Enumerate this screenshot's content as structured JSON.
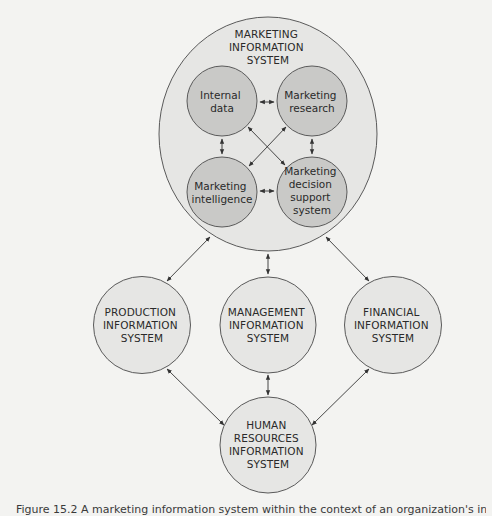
{
  "diagram": {
    "colors": {
      "background": "#f3f3f1",
      "outer_fill": "#e6e6e4",
      "inner_fill": "#c9c9c7",
      "stroke": "#5a5a5a",
      "text": "#2a2a2a"
    },
    "nodes": {
      "mis": {
        "label_lines": [
          "MARKETING",
          "INFORMATION",
          "SYSTEM"
        ]
      },
      "internal_data": {
        "label_lines": [
          "Internal",
          "data"
        ]
      },
      "marketing_research": {
        "label_lines": [
          "Marketing",
          "research"
        ]
      },
      "marketing_intelligence": {
        "label_lines": [
          "Marketing",
          "intelligence"
        ]
      },
      "mdss": {
        "label_lines": [
          "Marketing",
          "decision",
          "support",
          "system"
        ]
      },
      "production": {
        "label_lines": [
          "PRODUCTION",
          "INFORMATION",
          "SYSTEM"
        ]
      },
      "management": {
        "label_lines": [
          "MANAGEMENT",
          "INFORMATION",
          "SYSTEM"
        ]
      },
      "financial": {
        "label_lines": [
          "FINANCIAL",
          "INFORMATION",
          "SYSTEM"
        ]
      },
      "hr": {
        "label_lines": [
          "HUMAN",
          "RESOURCES",
          "INFORMATION",
          "SYSTEM"
        ]
      }
    },
    "edges": [
      {
        "from": "Internal data",
        "to": "Marketing research",
        "type": "bidirectional"
      },
      {
        "from": "Internal data",
        "to": "Marketing intelligence",
        "type": "bidirectional"
      },
      {
        "from": "Internal data",
        "to": "Marketing decision support system",
        "type": "bidirectional"
      },
      {
        "from": "Marketing research",
        "to": "Marketing intelligence",
        "type": "bidirectional"
      },
      {
        "from": "Marketing research",
        "to": "Marketing decision support system",
        "type": "bidirectional"
      },
      {
        "from": "Marketing intelligence",
        "to": "Marketing decision support system",
        "type": "bidirectional"
      },
      {
        "from": "Marketing Information System",
        "to": "Production Information System",
        "type": "bidirectional"
      },
      {
        "from": "Marketing Information System",
        "to": "Management Information System",
        "type": "bidirectional"
      },
      {
        "from": "Marketing Information System",
        "to": "Financial Information System",
        "type": "bidirectional"
      },
      {
        "from": "Production Information System",
        "to": "Human Resources Information System",
        "type": "bidirectional"
      },
      {
        "from": "Management Information System",
        "to": "Human Resources Information System",
        "type": "bidirectional"
      },
      {
        "from": "Financial Information System",
        "to": "Human Resources Information System",
        "type": "bidirectional"
      }
    ]
  },
  "caption": {
    "text": "Figure 15.2  A marketing information system within the context of an organization's information systems"
  }
}
